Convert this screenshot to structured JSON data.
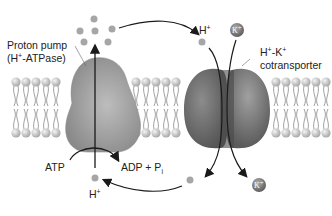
{
  "diagram": {
    "labels": {
      "proton_pump_line1": "Proton pump",
      "proton_pump_line2_pre": "(H",
      "proton_pump_line2_sup": "+",
      "proton_pump_line2_post": "-ATPase)",
      "cotransporter_line1_a": "H",
      "cotransporter_line1_sup1": "+",
      "cotransporter_line1_b": "-K",
      "cotransporter_line1_sup2": "+",
      "cotransporter_line2": "cotransporter",
      "h_top": "H",
      "h_top_sup": "+",
      "h_bottom": "H",
      "h_bottom_sup": "+",
      "atp": "ATP",
      "adp_pi": "ADP + P",
      "adp_pi_sub": "i",
      "k_ion_symbol": "K",
      "k_ion_sup": "+"
    },
    "colors": {
      "membrane_head": "#c8c8c8",
      "membrane_tail": "#9a9a9a",
      "pump_fill": "#9c9c9c",
      "cotransporter_fill": "#6f6f6f",
      "proton_dot": "#a8a8a8",
      "k_ion": "#7a7a7a",
      "arrow": "#1a1a1a"
    }
  }
}
